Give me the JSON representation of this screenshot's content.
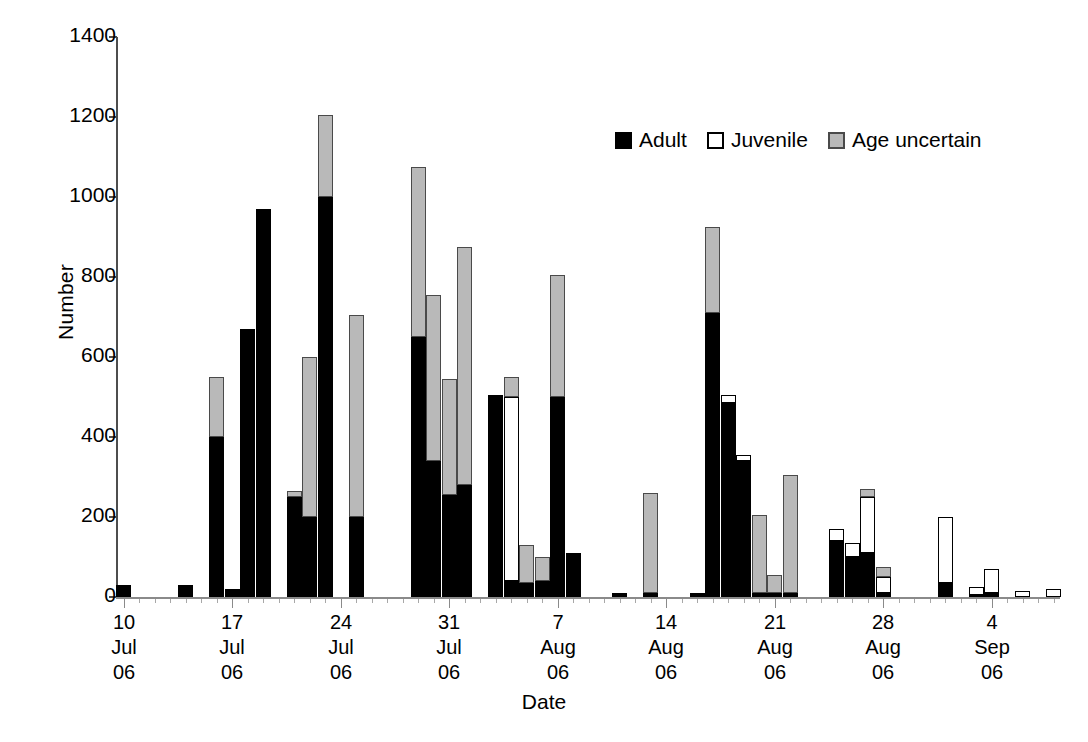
{
  "chart_data": {
    "type": "bar",
    "stacked": true,
    "title": "",
    "xlabel": "Date",
    "ylabel": "Number",
    "ylim": [
      0,
      1400
    ],
    "ytick_step": 200,
    "ytick_labels": [
      "0",
      "200",
      "400",
      "600",
      "800",
      "1000",
      "1200",
      "1400"
    ],
    "grid": false,
    "legend_position": "top-right",
    "series": [
      {
        "name": "Adult",
        "color": "#000000"
      },
      {
        "name": "Juvenile",
        "color": "#ffffff"
      },
      {
        "name": "Age uncertain",
        "color": "#b9b9b9"
      }
    ],
    "xtick_labels": [
      {
        "day": "10",
        "month": "Jul",
        "year": "06"
      },
      {
        "day": "17",
        "month": "Jul",
        "year": "06"
      },
      {
        "day": "24",
        "month": "Jul",
        "year": "06"
      },
      {
        "day": "31",
        "month": "Jul",
        "year": "06"
      },
      {
        "day": "7",
        "month": "Aug",
        "year": "06"
      },
      {
        "day": "14",
        "month": "Aug",
        "year": "06"
      },
      {
        "day": "21",
        "month": "Aug",
        "year": "06"
      },
      {
        "day": "28",
        "month": "Aug",
        "year": "06"
      },
      {
        "day": "4",
        "month": "Sep",
        "year": "06"
      }
    ],
    "x_start_date": "10 Jul 06",
    "x_end_date": "10 Sep 06",
    "x_day_count": 61,
    "bars": [
      {
        "x": 0,
        "date": "10 Jul 06",
        "adult": 30,
        "juvenile": 0,
        "uncertain": 0
      },
      {
        "x": 4,
        "date": "14 Jul 06",
        "adult": 30,
        "juvenile": 0,
        "uncertain": 0
      },
      {
        "x": 6,
        "date": "16 Jul 06",
        "adult": 400,
        "juvenile": 0,
        "uncertain": 150
      },
      {
        "x": 7,
        "date": "17 Jul 06",
        "adult": 20,
        "juvenile": 0,
        "uncertain": 0
      },
      {
        "x": 8,
        "date": "18 Jul 06",
        "adult": 670,
        "juvenile": 0,
        "uncertain": 0
      },
      {
        "x": 9,
        "date": "19 Jul 06",
        "adult": 970,
        "juvenile": 0,
        "uncertain": 0
      },
      {
        "x": 11,
        "date": "21 Jul 06",
        "adult": 250,
        "juvenile": 0,
        "uncertain": 15
      },
      {
        "x": 12,
        "date": "22 Jul 06",
        "adult": 200,
        "juvenile": 0,
        "uncertain": 400
      },
      {
        "x": 13,
        "date": "23 Jul 06",
        "adult": 1000,
        "juvenile": 0,
        "uncertain": 205
      },
      {
        "x": 15,
        "date": "25 Jul 06",
        "adult": 200,
        "juvenile": 0,
        "uncertain": 505
      },
      {
        "x": 19,
        "date": "29 Jul 06",
        "adult": 650,
        "juvenile": 0,
        "uncertain": 425
      },
      {
        "x": 20,
        "date": "30 Jul 06",
        "adult": 340,
        "juvenile": 0,
        "uncertain": 415
      },
      {
        "x": 21,
        "date": "31 Jul 06",
        "adult": 255,
        "juvenile": 0,
        "uncertain": 290
      },
      {
        "x": 22,
        "date": "1 Aug 06",
        "adult": 280,
        "juvenile": 0,
        "uncertain": 595
      },
      {
        "x": 24,
        "date": "3 Aug 06",
        "adult": 505,
        "juvenile": 0,
        "uncertain": 0
      },
      {
        "x": 25,
        "date": "4 Aug 06",
        "adult": 40,
        "juvenile": 460,
        "uncertain": 50
      },
      {
        "x": 26,
        "date": "5 Aug 06",
        "adult": 35,
        "juvenile": 0,
        "uncertain": 95
      },
      {
        "x": 27,
        "date": "6 Aug 06",
        "adult": 40,
        "juvenile": 0,
        "uncertain": 60
      },
      {
        "x": 28,
        "date": "7 Aug 06",
        "adult": 500,
        "juvenile": 0,
        "uncertain": 305
      },
      {
        "x": 29,
        "date": "8 Aug 06",
        "adult": 110,
        "juvenile": 0,
        "uncertain": 0
      },
      {
        "x": 32,
        "date": "11 Aug 06",
        "adult": 10,
        "juvenile": 0,
        "uncertain": 0
      },
      {
        "x": 34,
        "date": "13 Aug 06",
        "adult": 10,
        "juvenile": 0,
        "uncertain": 250
      },
      {
        "x": 37,
        "date": "16 Aug 06",
        "adult": 10,
        "juvenile": 0,
        "uncertain": 0
      },
      {
        "x": 38,
        "date": "17 Aug 06",
        "adult": 710,
        "juvenile": 0,
        "uncertain": 215
      },
      {
        "x": 39,
        "date": "18 Aug 06",
        "adult": 485,
        "juvenile": 20,
        "uncertain": 0
      },
      {
        "x": 40,
        "date": "19 Aug 06",
        "adult": 340,
        "juvenile": 15,
        "uncertain": 0
      },
      {
        "x": 41,
        "date": "20 Aug 06",
        "adult": 10,
        "juvenile": 0,
        "uncertain": 195
      },
      {
        "x": 42,
        "date": "21 Aug 06",
        "adult": 10,
        "juvenile": 0,
        "uncertain": 45
      },
      {
        "x": 43,
        "date": "22 Aug 06",
        "adult": 10,
        "juvenile": 0,
        "uncertain": 295
      },
      {
        "x": 46,
        "date": "25 Aug 06",
        "adult": 140,
        "juvenile": 30,
        "uncertain": 0
      },
      {
        "x": 47,
        "date": "26 Aug 06",
        "adult": 100,
        "juvenile": 35,
        "uncertain": 0
      },
      {
        "x": 48,
        "date": "27 Aug 06",
        "adult": 110,
        "juvenile": 140,
        "uncertain": 20
      },
      {
        "x": 49,
        "date": "28 Aug 06",
        "adult": 10,
        "juvenile": 40,
        "uncertain": 25
      },
      {
        "x": 53,
        "date": "1 Sep 06",
        "adult": 35,
        "juvenile": 165,
        "uncertain": 0
      },
      {
        "x": 55,
        "date": "3 Sep 06",
        "adult": 5,
        "juvenile": 20,
        "uncertain": 0
      },
      {
        "x": 56,
        "date": "4 Sep 06",
        "adult": 10,
        "juvenile": 60,
        "uncertain": 0
      },
      {
        "x": 58,
        "date": "6 Sep 06",
        "adult": 0,
        "juvenile": 15,
        "uncertain": 0
      },
      {
        "x": 60,
        "date": "8 Sep 06",
        "adult": 0,
        "juvenile": 20,
        "uncertain": 0
      }
    ]
  },
  "legend": {
    "items": [
      {
        "label": "Adult",
        "swatch": "adult"
      },
      {
        "label": "Juvenile",
        "swatch": "juvenile"
      },
      {
        "label": "Age uncertain",
        "swatch": "uncertain"
      }
    ]
  }
}
